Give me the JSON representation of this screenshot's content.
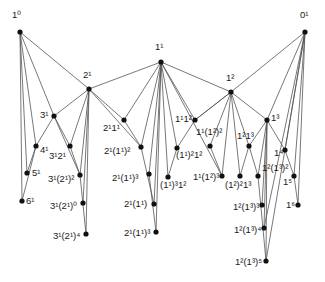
{
  "diagram": {
    "type": "lattice-graph",
    "colors": {
      "edge": "#555555",
      "node": "#111111",
      "background": "#ffffff",
      "text": "#1a1a1a"
    },
    "nodes": [
      {
        "id": "n10",
        "label": "1⁰",
        "base": "1",
        "sup": "0",
        "x": 20,
        "y": 32,
        "lx": 12,
        "ly": 10
      },
      {
        "id": "n01",
        "label": "0¹",
        "base": "0",
        "sup": "1",
        "x": 305,
        "y": 32,
        "lx": 300,
        "ly": 10
      },
      {
        "id": "n11",
        "label": "1¹",
        "base": "1",
        "sup": "1",
        "x": 161,
        "y": 62,
        "lx": 155,
        "ly": 42
      },
      {
        "id": "n21",
        "label": "2¹",
        "base": "2",
        "sup": "1",
        "x": 89,
        "y": 89,
        "lx": 83,
        "ly": 70
      },
      {
        "id": "n12",
        "label": "1²",
        "base": "1",
        "sup": "2",
        "x": 231,
        "y": 92,
        "lx": 226,
        "ly": 73
      },
      {
        "id": "n13",
        "label": "1³",
        "base": "1",
        "sup": "3",
        "x": 267,
        "y": 120,
        "lx": 271,
        "ly": 113
      },
      {
        "id": "n31",
        "label": "3¹",
        "base": "3",
        "sup": "1",
        "x": 54,
        "y": 116,
        "lx": 40,
        "ly": 110
      },
      {
        "id": "n41",
        "label": "4¹",
        "base": "4",
        "sup": "1",
        "x": 36,
        "y": 146,
        "lx": 40,
        "ly": 145
      },
      {
        "id": "n3121",
        "label": "3¹2¹",
        "base": "3¹2",
        "sup": "1",
        "x": 70,
        "y": 146,
        "lx": 49,
        "ly": 151
      },
      {
        "id": "n51",
        "label": "5¹",
        "base": "5",
        "sup": "1",
        "x": 27,
        "y": 173,
        "lx": 32,
        "ly": 168
      },
      {
        "id": "n61",
        "label": "6¹",
        "base": "6",
        "sup": "1",
        "x": 22,
        "y": 201,
        "lx": 26,
        "ly": 196
      },
      {
        "id": "n3121sq",
        "label": "3¹(2¹)²",
        "base": "3¹(2¹)",
        "sup": "2",
        "x": 80,
        "y": 175,
        "lx": 48,
        "ly": 174
      },
      {
        "id": "n3121z",
        "label": "3¹(2¹)⁰",
        "base": "3¹(2¹)",
        "sup": "0",
        "x": 83,
        "y": 203,
        "lx": 50,
        "ly": 201
      },
      {
        "id": "n3121q",
        "label": "3¹(2¹)⁴",
        "base": "3¹(2¹)",
        "sup": "4",
        "x": 86,
        "y": 234,
        "lx": 53,
        "ly": 231
      },
      {
        "id": "n2111",
        "label": "2¹1¹",
        "base": "2¹1",
        "sup": "1",
        "x": 124,
        "y": 120,
        "lx": 103,
        "ly": 123
      },
      {
        "id": "n2111sq",
        "label": "2¹(1¹)²",
        "base": "2¹(1¹)",
        "sup": "2",
        "x": 141,
        "y": 147,
        "lx": 104,
        "ly": 146
      },
      {
        "id": "n2111cu",
        "label": "2¹(1¹)³",
        "base": "2¹(1¹)",
        "sup": "3",
        "x": 149,
        "y": 174,
        "lx": 112,
        "ly": 173
      },
      {
        "id": "n2111",
        "label": "2¹(1¹)",
        "base": "2¹(1¹)",
        "sup": "",
        "x": 154,
        "y": 204,
        "lx": 124,
        "ly": 199
      },
      {
        "id": "n2111cu2",
        "label": "2¹(1¹)³",
        "base": "2¹(1¹)",
        "sup": "3",
        "x": 156,
        "y": 232,
        "lx": 124,
        "ly": 228
      },
      {
        "id": "n1112",
        "label": "1¹1²",
        "base": "1¹1",
        "sup": "2",
        "x": 195,
        "y": 120,
        "lx": 175,
        "ly": 114
      },
      {
        "id": "n11sq12",
        "label": "(1¹)²1²",
        "base": "(1¹)²1",
        "sup": "2",
        "x": 177,
        "y": 148,
        "lx": 176,
        "ly": 150
      },
      {
        "id": "n11cu12",
        "label": "(1¹)³1²",
        "base": "(1¹)³1",
        "sup": "2",
        "x": 168,
        "y": 177,
        "lx": 160,
        "ly": 180
      },
      {
        "id": "n1112sq",
        "label": "1¹(1²)²",
        "base": "1¹(1²)",
        "sup": "2",
        "x": 210,
        "y": 146,
        "lx": 196,
        "ly": 127
      },
      {
        "id": "n1112cu",
        "label": "1¹(1²)³",
        "base": "1¹(1²)",
        "sup": "3",
        "x": 222,
        "y": 176,
        "lx": 193,
        "ly": 172
      },
      {
        "id": "n1213",
        "label": "1²1³",
        "base": "1²1",
        "sup": "3",
        "x": 249,
        "y": 146,
        "lx": 237,
        "ly": 131
      },
      {
        "id": "n12sq13",
        "label": "(1²)²1³",
        "base": "(1²)²1",
        "sup": "3",
        "x": 240,
        "y": 176,
        "lx": 225,
        "ly": 180
      },
      {
        "id": "n1213sq",
        "label": "1²(1³)²",
        "base": "1²(1³)",
        "sup": "2",
        "x": 258,
        "y": 176,
        "lx": 262,
        "ly": 163
      },
      {
        "id": "n1213cu",
        "label": "1²(1³)³",
        "base": "1²(1³)",
        "sup": "3",
        "x": 262,
        "y": 205,
        "lx": 233,
        "ly": 202
      },
      {
        "id": "n1213q",
        "label": "1²(1³)⁴",
        "base": "1²(1³)",
        "sup": "4",
        "x": 264,
        "y": 228,
        "lx": 234,
        "ly": 225
      },
      {
        "id": "n1213f",
        "label": "1²(1³)⁵",
        "base": "1²(1³)",
        "sup": "5",
        "x": 266,
        "y": 261,
        "lx": 235,
        "ly": 257
      },
      {
        "id": "n14",
        "label": "1⁴",
        "base": "1",
        "sup": "4",
        "x": 285,
        "y": 150,
        "lx": 274,
        "ly": 148
      },
      {
        "id": "n15",
        "label": "1⁵",
        "base": "1",
        "sup": "5",
        "x": 294,
        "y": 176,
        "lx": 283,
        "ly": 177
      },
      {
        "id": "n16",
        "label": "1⁶",
        "base": "1",
        "sup": "6",
        "x": 298,
        "y": 205,
        "lx": 286,
        "ly": 200
      }
    ],
    "edges": [
      [
        20,
        32,
        89,
        89
      ],
      [
        20,
        32,
        36,
        146
      ],
      [
        20,
        32,
        27,
        173
      ],
      [
        20,
        32,
        22,
        201
      ],
      [
        20,
        32,
        54,
        116
      ],
      [
        36,
        146,
        22,
        201
      ],
      [
        54,
        116,
        36,
        146
      ],
      [
        54,
        116,
        80,
        175
      ],
      [
        36,
        146,
        27,
        173
      ],
      [
        89,
        89,
        161,
        62
      ],
      [
        89,
        89,
        54,
        116
      ],
      [
        89,
        89,
        70,
        146
      ],
      [
        89,
        89,
        124,
        120
      ],
      [
        89,
        89,
        80,
        175
      ],
      [
        89,
        89,
        83,
        203
      ],
      [
        89,
        89,
        86,
        234
      ],
      [
        89,
        89,
        141,
        147
      ],
      [
        54,
        116,
        70,
        146
      ],
      [
        70,
        146,
        80,
        175
      ],
      [
        80,
        175,
        86,
        234
      ],
      [
        161,
        62,
        231,
        92
      ],
      [
        161,
        62,
        124,
        120
      ],
      [
        161,
        62,
        141,
        147
      ],
      [
        161,
        62,
        149,
        174
      ],
      [
        161,
        62,
        154,
        204
      ],
      [
        161,
        62,
        156,
        232
      ],
      [
        161,
        62,
        195,
        120
      ],
      [
        161,
        62,
        177,
        148
      ],
      [
        161,
        62,
        168,
        177
      ],
      [
        161,
        62,
        222,
        176
      ],
      [
        124,
        120,
        141,
        147
      ],
      [
        141,
        147,
        154,
        204
      ],
      [
        149,
        174,
        156,
        232
      ],
      [
        195,
        120,
        231,
        92
      ],
      [
        195,
        120,
        177,
        148
      ],
      [
        177,
        148,
        168,
        177
      ],
      [
        231,
        92,
        305,
        32
      ],
      [
        231,
        92,
        195,
        120
      ],
      [
        231,
        92,
        210,
        146
      ],
      [
        231,
        92,
        222,
        176
      ],
      [
        231,
        92,
        240,
        176
      ],
      [
        231,
        92,
        249,
        146
      ],
      [
        231,
        92,
        267,
        120
      ],
      [
        210,
        146,
        222,
        176
      ],
      [
        267,
        120,
        305,
        32
      ],
      [
        267,
        120,
        249,
        146
      ],
      [
        267,
        120,
        258,
        176
      ],
      [
        267,
        120,
        262,
        205
      ],
      [
        267,
        120,
        264,
        228
      ],
      [
        267,
        120,
        266,
        261
      ],
      [
        267,
        120,
        285,
        150
      ],
      [
        249,
        146,
        240,
        176
      ],
      [
        249,
        146,
        258,
        176
      ],
      [
        258,
        176,
        266,
        261
      ],
      [
        285,
        150,
        294,
        176
      ],
      [
        294,
        176,
        298,
        205
      ],
      [
        305,
        32,
        285,
        150
      ],
      [
        305,
        32,
        294,
        176
      ],
      [
        305,
        32,
        298,
        205
      ],
      [
        305,
        32,
        266,
        261
      ],
      [
        305,
        32,
        264,
        228
      ]
    ]
  }
}
